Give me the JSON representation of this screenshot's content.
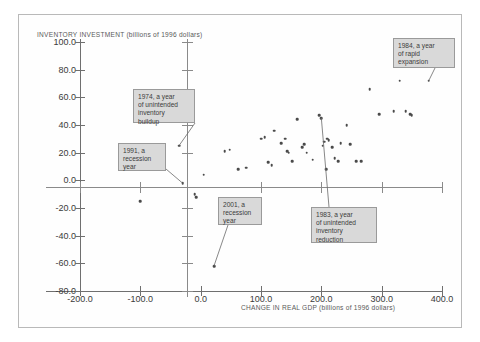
{
  "figure": {
    "y_axis_title": "INVENTORY INVESTMENT (billions of 1996 dollars)",
    "x_axis_title": "CHANGE IN REAL GDP (billions of 1996 dollars)"
  },
  "chart_data": {
    "type": "scatter",
    "title": "",
    "xlabel": "CHANGE IN REAL GDP (billions of 1996 dollars)",
    "ylabel": "INVENTORY INVESTMENT (billions of 1996 dollars)",
    "xlim": [
      -200,
      400
    ],
    "ylim": [
      -80,
      100
    ],
    "grid": false,
    "legend": "none",
    "xticks": [
      "-200.0",
      "-100.0",
      "0.0",
      "100.0",
      "200.0",
      "300.0",
      "400.0"
    ],
    "xtick_values": [
      -200,
      -100,
      0,
      100,
      200,
      300,
      400
    ],
    "yticks": [
      "100.0",
      "80.0",
      "60.0",
      "40.0",
      "20.0",
      "0.0",
      "-20.0",
      "-40.0",
      "-60.0",
      "-80.0"
    ],
    "ytick_values": [
      100,
      80,
      60,
      40,
      20,
      0,
      -20,
      -40,
      -60,
      -80
    ],
    "points": [
      {
        "x": -100,
        "y": -15
      },
      {
        "x": -36,
        "y": 25
      },
      {
        "x": -30,
        "y": -2
      },
      {
        "x": -10,
        "y": -10
      },
      {
        "x": -7,
        "y": -12
      },
      {
        "x": 5,
        "y": 4
      },
      {
        "x": 22,
        "y": -62
      },
      {
        "x": 40,
        "y": 21
      },
      {
        "x": 48,
        "y": 22
      },
      {
        "x": 62,
        "y": 8
      },
      {
        "x": 75,
        "y": 9
      },
      {
        "x": 100,
        "y": 30
      },
      {
        "x": 106,
        "y": 31
      },
      {
        "x": 112,
        "y": 13
      },
      {
        "x": 118,
        "y": 11
      },
      {
        "x": 122,
        "y": 36
      },
      {
        "x": 133,
        "y": 27
      },
      {
        "x": 140,
        "y": 30
      },
      {
        "x": 143,
        "y": 21
      },
      {
        "x": 146,
        "y": 20
      },
      {
        "x": 152,
        "y": 14
      },
      {
        "x": 160,
        "y": 44
      },
      {
        "x": 168,
        "y": 24
      },
      {
        "x": 172,
        "y": 26
      },
      {
        "x": 176,
        "y": 20
      },
      {
        "x": 186,
        "y": 15
      },
      {
        "x": 196,
        "y": 47
      },
      {
        "x": 200,
        "y": 45
      },
      {
        "x": 202,
        "y": 25
      },
      {
        "x": 205,
        "y": 28
      },
      {
        "x": 208,
        "y": 8
      },
      {
        "x": 210,
        "y": 30
      },
      {
        "x": 212,
        "y": 29
      },
      {
        "x": 218,
        "y": 24
      },
      {
        "x": 222,
        "y": 16
      },
      {
        "x": 228,
        "y": 14
      },
      {
        "x": 232,
        "y": 27
      },
      {
        "x": 242,
        "y": 40
      },
      {
        "x": 248,
        "y": 26
      },
      {
        "x": 258,
        "y": 14
      },
      {
        "x": 266,
        "y": 14
      },
      {
        "x": 280,
        "y": 66
      },
      {
        "x": 296,
        "y": 48
      },
      {
        "x": 320,
        "y": 50
      },
      {
        "x": 330,
        "y": 72
      },
      {
        "x": 340,
        "y": 50
      },
      {
        "x": 347,
        "y": 48
      },
      {
        "x": 350,
        "y": 47
      },
      {
        "x": 378,
        "y": 72
      }
    ],
    "annotations": [
      {
        "id": "1974",
        "text": "1974, a year\nof unintended\ninventory\nbuildup",
        "target": {
          "x": -36,
          "y": 25
        }
      },
      {
        "id": "1991",
        "text": "1991, a\nrecession\nyear",
        "target": {
          "x": -30,
          "y": -2
        }
      },
      {
        "id": "2001",
        "text": "2001, a\nrecession\nyear",
        "target": {
          "x": 22,
          "y": -62
        }
      },
      {
        "id": "1983",
        "text": "1983, a year\nof unintended\ninventory\nreduction",
        "target": {
          "x": 200,
          "y": 45
        }
      },
      {
        "id": "1984",
        "text": "1984, a year\nof rapid\nexpansion",
        "target": {
          "x": 378,
          "y": 72
        }
      }
    ]
  }
}
